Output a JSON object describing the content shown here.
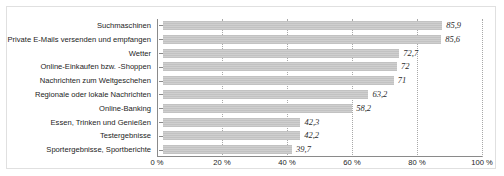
{
  "chart_data": {
    "type": "bar",
    "orientation": "horizontal",
    "title": "",
    "xlabel": "",
    "ylabel": "",
    "xlim": [
      0,
      100
    ],
    "grid": true,
    "legend": false,
    "categories": [
      "Suchmaschinen",
      "Private E-Mails versenden und empfangen",
      "Wetter",
      "Online-Einkaufen bzw. -Shoppen",
      "Nachrichten zum Weltgeschehen",
      "Regionale oder lokale Nachrichten",
      "Online-Banking",
      "Essen, Trinken und Genießen",
      "Testergebnisse",
      "Sportergebnisse, Sportberichte"
    ],
    "values": [
      85.9,
      85.6,
      72.7,
      72,
      71,
      63.2,
      58.2,
      42.3,
      42.2,
      39.7
    ],
    "value_labels": [
      "85,9",
      "85,6",
      "72,7",
      "72",
      "71",
      "63,2",
      "58,2",
      "42,3",
      "42,2",
      "39,7"
    ],
    "xticks": [
      0,
      20,
      40,
      60,
      80,
      100
    ],
    "xtick_labels": [
      "0 %",
      "20 %",
      "40 %",
      "60 %",
      "80 %",
      "100 %"
    ],
    "bar_color": "#c8c8c8",
    "gridline_color": "#a8a8a8",
    "axis_color": "#8a8a8a"
  }
}
